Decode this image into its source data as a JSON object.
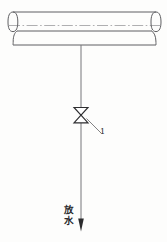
{
  "diagram": {
    "background_color": "#fdfdfc",
    "line_color": "#6e6e70",
    "ink_color": "#2a2a2c",
    "header_pipe": {
      "name": "horizontal-header-pipe",
      "orientation": "horizontal",
      "left_x": 13,
      "right_x": 156,
      "top_y": 12,
      "bottom_y": 45,
      "cap_ellipse_rx": 5,
      "cap_ellipse_ry": 10,
      "centerline_y": 25,
      "inner_line_y": 31,
      "centerline_style": "dash-dot"
    },
    "drain_pipe": {
      "name": "vertical-drain-pipe",
      "x": 81,
      "top_y": 45,
      "bottom_y": 222
    },
    "valve": {
      "name": "gate-valve",
      "symbol": "gate-valve-bowtie",
      "center_x": 81,
      "center_y": 115,
      "half_width": 7,
      "half_height": 7.5,
      "callout_number": "1"
    },
    "leader": {
      "name": "valve-leader-line",
      "from_x": 87,
      "from_y": 119,
      "to_x": 101,
      "to_y": 133
    },
    "outlet_arrow": {
      "name": "discharge-arrow",
      "x": 81,
      "tip_y": 231,
      "tail_y": 219,
      "half_width": 3
    },
    "labels": {
      "callout_1": "1",
      "outlet_chars": [
        "放",
        "水"
      ],
      "outlet_text": "放水"
    }
  }
}
